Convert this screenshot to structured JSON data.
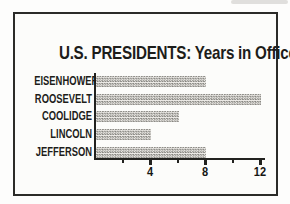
{
  "figure": {
    "title": "U.S. PRESIDENTS: Years in Office"
  },
  "chart_data": {
    "type": "bar",
    "orientation": "horizontal",
    "title": "U.S. PRESIDENTS: Years in Office",
    "categories": [
      "EISENHOWER",
      "ROOSEVELT",
      "COOLIDGE",
      "LINCOLN",
      "JEFFERSON"
    ],
    "values": [
      8,
      12,
      6,
      4,
      8
    ],
    "unit": "years",
    "xlabel": "",
    "ylabel": "",
    "xlim": [
      0,
      12.4
    ],
    "x_major_ticks": [
      4,
      8,
      12
    ],
    "x_minor_ticks": [
      2,
      6,
      10
    ],
    "x_tick_labels": [
      "4",
      "8",
      "12"
    ],
    "grid": false,
    "legend": "none",
    "bar_style": "halftone-checker-gray",
    "colors": {
      "ink": "#22221f",
      "bar_gray": "#85847f",
      "paper": "#fcfcfa"
    }
  }
}
